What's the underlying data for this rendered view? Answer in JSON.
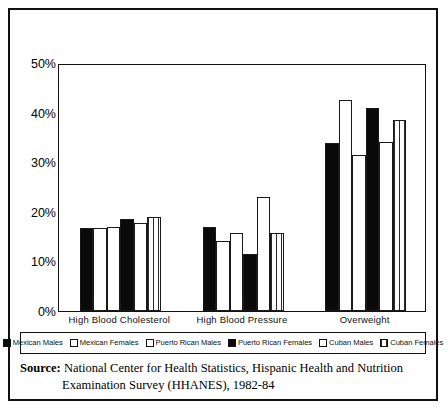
{
  "figure": {
    "source_label": "Source:",
    "source_line1": "National Center for Health Statistics, Hispanic Health and Nutrition",
    "source_line2": "Examination Survey (HHANES), 1982-84"
  },
  "legend": {
    "items": [
      {
        "label": "Mexican Males",
        "pattern": "solid",
        "swatch_name": "legend-swatch-mexican-males"
      },
      {
        "label": "Mexican Females",
        "pattern": "white",
        "swatch_name": "legend-swatch-mexican-females"
      },
      {
        "label": "Puerto Rican Males",
        "pattern": "white",
        "swatch_name": "legend-swatch-puerto-rican-males"
      },
      {
        "label": "Puerto Rican Females",
        "pattern": "solid",
        "swatch_name": "legend-swatch-puerto-rican-females"
      },
      {
        "label": "Cuban Males",
        "pattern": "dots",
        "swatch_name": "legend-swatch-cuban-males"
      },
      {
        "label": "Cuban Females",
        "pattern": "vlines",
        "swatch_name": "legend-swatch-cuban-females"
      }
    ]
  },
  "chart_data": {
    "type": "bar",
    "title": "",
    "xlabel": "",
    "ylabel": "",
    "ylim": [
      0,
      50
    ],
    "yticks": [
      0,
      10,
      20,
      30,
      40,
      50
    ],
    "ytick_labels": [
      "0%",
      "10%",
      "20%",
      "30%",
      "40%",
      "50%"
    ],
    "grid": false,
    "legend_position": "bottom",
    "categories": [
      "High Blood Cholesterol",
      "High Blood Pressure",
      "Overweight"
    ],
    "series": [
      {
        "name": "Mexican Males",
        "pattern": "solid",
        "values": [
          16.8,
          17.0,
          33.8
        ]
      },
      {
        "name": "Mexican Females",
        "pattern": "white",
        "values": [
          16.7,
          14.2,
          42.5
        ]
      },
      {
        "name": "Puerto Rican Males",
        "pattern": "white",
        "values": [
          17.0,
          15.8,
          31.5
        ]
      },
      {
        "name": "Puerto Rican Females",
        "pattern": "solid",
        "values": [
          18.5,
          11.5,
          41.0
        ]
      },
      {
        "name": "Cuban Males",
        "pattern": "dots",
        "values": [
          17.8,
          22.9,
          34.0
        ]
      },
      {
        "name": "Cuban Females",
        "pattern": "vlines",
        "values": [
          19.0,
          15.7,
          38.5
        ]
      }
    ]
  }
}
